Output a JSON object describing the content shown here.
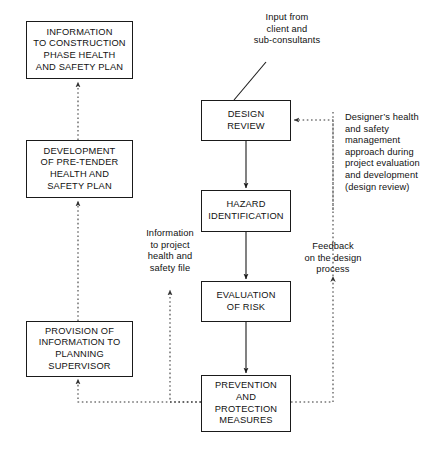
{
  "diagram": {
    "colors": {
      "stroke": "#1a1a1a",
      "text": "#111111",
      "background": "#ffffff",
      "dotted": "#555555"
    },
    "nodes": [
      {
        "id": "information-to-construction-phase-plan",
        "label": "INFORMATION\nTO CONSTRUCTION\nPHASE HEALTH\nAND SAFETY PLAN",
        "x": 26,
        "y": 21,
        "w": 107,
        "h": 58
      },
      {
        "id": "development-of-pre-tender-plan",
        "label": "DEVELOPMENT\nOF PRE-TENDER\nHEALTH AND\nSAFETY PLAN",
        "x": 26,
        "y": 140,
        "w": 107,
        "h": 58
      },
      {
        "id": "provision-of-information-to-planning-supervisor",
        "label": "PROVISION OF\nINFORMATION TO\nPLANNING\nSUPERVISOR",
        "x": 26,
        "y": 321,
        "w": 107,
        "h": 56
      },
      {
        "id": "design-review",
        "label": "DESIGN\nREVIEW",
        "x": 201,
        "y": 100,
        "w": 90,
        "h": 41
      },
      {
        "id": "hazard-identification",
        "label": "HAZARD\nIDENTIFICATION",
        "x": 201,
        "y": 190,
        "w": 90,
        "h": 42
      },
      {
        "id": "evaluation-of-risk",
        "label": "EVALUATION\nOF RISK",
        "x": 201,
        "y": 281,
        "w": 90,
        "h": 41
      },
      {
        "id": "prevention-and-protection-measures",
        "label": "PREVENTION\nAND\nPROTECTION\nMEASURES",
        "x": 201,
        "y": 375,
        "w": 90,
        "h": 57
      }
    ],
    "annotations": [
      {
        "id": "input-from-client",
        "label": "Input from\nclient and\nsub-consultants",
        "x": 232,
        "y": 12,
        "w": 110,
        "align": "center"
      },
      {
        "id": "designers-health-and-safety-management",
        "label": "Designer’s health\nand safety\nmanagement\napproach during\nproject evaluation\nand development\n(design review)",
        "x": 345,
        "y": 112,
        "w": 100,
        "align": "left"
      },
      {
        "id": "information-to-project-health-and-safety-file",
        "label": "Information\nto project\nhealth and\nsafety file",
        "x": 129,
        "y": 228,
        "w": 82,
        "align": "center"
      },
      {
        "id": "feedback-on-the-design-process",
        "label": "Feedback\non the design\nprocess",
        "x": 290,
        "y": 241,
        "w": 86,
        "align": "center"
      }
    ],
    "edges": [
      {
        "id": "prevention-to-provision",
        "style": "dotted",
        "from": "prevention-and-protection-measures",
        "to": "provision-of-information-to-planning-supervisor"
      },
      {
        "id": "provision-to-development",
        "style": "dotted",
        "from": "provision-of-information-to-planning-supervisor",
        "to": "development-of-pre-tender-plan"
      },
      {
        "id": "development-to-construction-phase",
        "style": "dotted",
        "from": "development-of-pre-tender-plan",
        "to": "information-to-construction-phase-plan"
      },
      {
        "id": "prevention-to-project-file",
        "style": "dotted",
        "from": "prevention-and-protection-measures",
        "to": "information-to-project-health-and-safety-file"
      },
      {
        "id": "prevention-to-design-review-feedback",
        "style": "dotted",
        "from": "prevention-and-protection-measures",
        "to": "design-review"
      },
      {
        "id": "design-review-to-hazard-identification",
        "style": "solid",
        "from": "design-review",
        "to": "hazard-identification"
      },
      {
        "id": "hazard-identification-to-evaluation-of-risk",
        "style": "solid",
        "from": "hazard-identification",
        "to": "evaluation-of-risk"
      },
      {
        "id": "evaluation-of-risk-to-prevention",
        "style": "solid",
        "from": "evaluation-of-risk",
        "to": "prevention-and-protection-measures"
      },
      {
        "id": "input-leader-line",
        "style": "solid-plain",
        "from": "input-from-client",
        "to": "design-review"
      }
    ]
  }
}
